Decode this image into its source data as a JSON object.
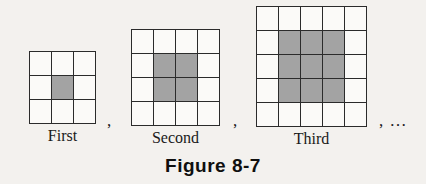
{
  "figure": {
    "caption": "Figure 8-7",
    "background_color": "#f3f1ee",
    "cell_fill_color": "#fbfaf8",
    "shaded_fill_color": "#a3a3a3",
    "border_color": "#2b2b2b",
    "separators": {
      "after_first": ",",
      "after_second": ",",
      "after_third": ", …"
    },
    "terms": [
      {
        "label": "First",
        "rows": 3,
        "cols": 4,
        "grid_size": 3,
        "total_cells": 9,
        "shaded_rows": [
          2
        ],
        "shaded_cols": [
          2
        ],
        "shaded_count": 1,
        "shaded_block": "1x1"
      },
      {
        "label": "Second",
        "rows": 4,
        "cols": 4,
        "grid_size": 4,
        "total_cells": 16,
        "shaded_rows": [
          2,
          3
        ],
        "shaded_cols": [
          2,
          3
        ],
        "shaded_count": 4,
        "shaded_block": "2x2"
      },
      {
        "label": "Third",
        "rows": 5,
        "cols": 5,
        "grid_size": 5,
        "total_cells": 25,
        "shaded_rows": [
          2,
          3,
          4
        ],
        "shaded_cols": [
          2,
          3,
          4
        ],
        "shaded_count": 9,
        "shaded_block": "3x3"
      }
    ]
  },
  "chart_data": {
    "type": "diagram",
    "title": "Figure 8-7",
    "categories": [
      "First",
      "Second",
      "Third"
    ],
    "series": [
      {
        "name": "Grid side length",
        "values": [
          3,
          4,
          5
        ]
      },
      {
        "name": "Total cells",
        "values": [
          9,
          16,
          25
        ]
      },
      {
        "name": "Shaded cells",
        "values": [
          1,
          4,
          9
        ]
      }
    ],
    "continues": true,
    "continuation_symbol": ", …"
  }
}
